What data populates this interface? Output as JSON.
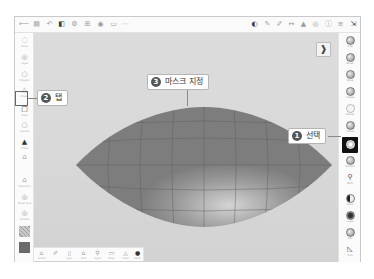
{
  "topbar": {
    "left_icons": [
      {
        "name": "back-icon",
        "glyph": "⟵"
      },
      {
        "name": "file-icon",
        "glyph": "▤"
      },
      {
        "name": "undo-icon",
        "glyph": "↶"
      },
      {
        "name": "layers-icon",
        "glyph": "◧"
      },
      {
        "name": "settings-icon",
        "glyph": "⚙"
      },
      {
        "name": "grid-icon",
        "glyph": "⊞"
      },
      {
        "name": "camera-icon",
        "glyph": "◉"
      },
      {
        "name": "ruler-icon",
        "glyph": "▭"
      },
      {
        "name": "more-icon",
        "glyph": "⋯"
      }
    ],
    "right_icons": [
      {
        "name": "material-icon",
        "glyph": "◐"
      },
      {
        "name": "brush-icon",
        "glyph": "✎"
      },
      {
        "name": "pen-icon",
        "glyph": "✐"
      },
      {
        "name": "move-icon",
        "glyph": "↔"
      },
      {
        "name": "select-icon",
        "glyph": "▲"
      },
      {
        "name": "view-icon",
        "glyph": "◎"
      },
      {
        "name": "info-icon",
        "glyph": "ⓘ"
      },
      {
        "name": "menu-icon",
        "glyph": "≡"
      },
      {
        "name": "collapse-icon",
        "glyph": "⇲"
      }
    ]
  },
  "left_toolbar": {
    "items": [
      {
        "name": "tool-draw",
        "glyph": "◌",
        "label": "Draw"
      },
      {
        "name": "tool-layer",
        "glyph": "◎",
        "label": "Layer"
      },
      {
        "name": "tool-polygon",
        "glyph": "○",
        "label": "Polygon"
      },
      {
        "name": "tool-shape",
        "glyph": "△",
        "label": "Shape"
      },
      {
        "name": "tool-mask",
        "glyph": "□",
        "label": "Mask"
      },
      {
        "name": "tool-options",
        "glyph": "○",
        "label": "Options"
      },
      {
        "name": "tool-scene",
        "glyph": "▲",
        "label": "Scene"
      },
      {
        "name": "tool-home",
        "glyph": "⌂",
        "label": "Home"
      },
      {
        "name": "tool-transform",
        "glyph": "⌂",
        "label": "Transform"
      },
      {
        "name": "tool-brushsize",
        "glyph": "◎",
        "label": "Brush Size"
      },
      {
        "name": "tool-smooth",
        "glyph": "◎",
        "label": "Smooth"
      }
    ],
    "swatch_pattern_color": "#b5b5b5",
    "swatch_color": "#6b6b6b"
  },
  "right_toolbar": {
    "items": [
      {
        "name": "brush-clay",
        "label": "Clay"
      },
      {
        "name": "brush-standard",
        "label": "Brush"
      },
      {
        "name": "brush-move",
        "label": "Move"
      },
      {
        "name": "brush-crease",
        "label": "Crease"
      },
      {
        "name": "brush-flatten",
        "label": "Flatten"
      },
      {
        "name": "brush-inflate",
        "label": "Inflate"
      },
      {
        "name": "brush-mask",
        "label": "Mask",
        "selected": true
      },
      {
        "name": "brush-smooth",
        "label": "Smooth"
      },
      {
        "name": "brush-paint",
        "label": "Paint"
      },
      {
        "name": "brush-pinch",
        "label": "Pinch"
      },
      {
        "name": "brush-layer",
        "label": "Layer"
      },
      {
        "name": "brush-flat",
        "label": "Flat"
      },
      {
        "name": "brush-trim",
        "label": "Trim"
      }
    ]
  },
  "bottom_toolbar": {
    "items": [
      {
        "name": "btn-home",
        "glyph": "⌂",
        "label": "Home"
      },
      {
        "name": "btn-pen",
        "glyph": "✐",
        "label": ""
      },
      {
        "name": "btn-sym",
        "glyph": "▯",
        "label": "Sym"
      },
      {
        "name": "btn-lock",
        "glyph": "⌂",
        "label": "Lock"
      },
      {
        "name": "btn-dyno",
        "glyph": "⚲",
        "label": "Dyno"
      },
      {
        "name": "btn-mask",
        "glyph": "▭",
        "label": "Mask"
      },
      {
        "name": "btn-invert",
        "glyph": "◬",
        "label": "Invert"
      },
      {
        "name": "btn-mesh",
        "glyph": "●",
        "label": "Mesh"
      }
    ]
  },
  "canvas": {
    "background": "#d9d9d9",
    "mesh_color": "#7d7d7d",
    "mesh_highlight": "#c6c6c6",
    "wire_color": "#5f5f5f",
    "pin_icon": "📌"
  },
  "callouts": [
    {
      "number": "1",
      "text": "선택"
    },
    {
      "number": "2",
      "text": "탭"
    },
    {
      "number": "3",
      "text": "마스크 지정"
    }
  ]
}
